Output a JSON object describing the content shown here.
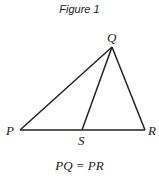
{
  "figure": {
    "title": "Figure 1",
    "points": {
      "P": "P",
      "Q": "Q",
      "R": "R",
      "S": "S"
    },
    "segments": [
      "PQ",
      "QR",
      "PR",
      "QS"
    ],
    "caption": "PQ = PR",
    "stroke_color": "#222222"
  }
}
